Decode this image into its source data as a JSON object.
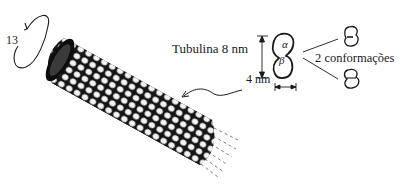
{
  "diagram": {
    "rotation_label": "13",
    "tubulin_label": "Tubulina 8 nm",
    "width_label": "4 nm",
    "alpha_label": "α",
    "beta_label": "β",
    "conformations_label": "2 conformações",
    "colors": {
      "ink": "#1a1a1a",
      "background": "#ffffff"
    }
  }
}
